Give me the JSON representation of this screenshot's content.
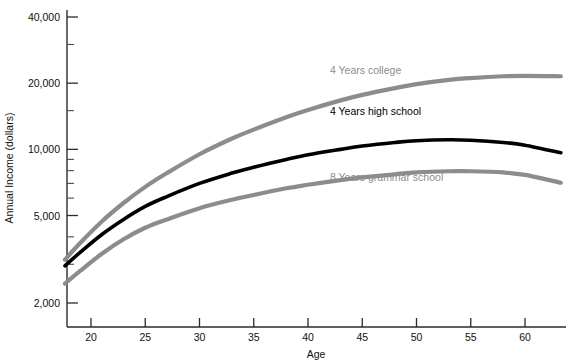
{
  "chart_data": {
    "type": "line",
    "title": "",
    "xlabel": "Age",
    "ylabel": "Annual Income (dollars)",
    "yscale": "log",
    "ylim": [
      1700,
      47000
    ],
    "xlim": [
      17.5,
      63.5
    ],
    "grid": false,
    "legend_position": "inline-on-curve",
    "y_major_ticks": [
      2000,
      5000,
      10000,
      20000,
      40000
    ],
    "y_major_tick_labels": [
      "2,000",
      "5,000",
      "10,000",
      "20,000",
      "40,000"
    ],
    "y_minor_ticks": [
      3000,
      4000,
      6000,
      7000,
      8000,
      9000,
      15000,
      30000
    ],
    "x_ticks": [
      20,
      25,
      30,
      35,
      40,
      45,
      50,
      55,
      60
    ],
    "x_tick_labels": [
      "20",
      "25",
      "30",
      "35",
      "40",
      "45",
      "50",
      "55",
      "60"
    ],
    "x": [
      17.6,
      19,
      21,
      23,
      25,
      27,
      30,
      33,
      35,
      38,
      40,
      43,
      45,
      48,
      50,
      53,
      55,
      58,
      60,
      63.3
    ],
    "series": [
      {
        "name": "4 Years college",
        "label": "4 Years college",
        "color": "#8c8c8c",
        "width": 4.2,
        "label_x": 330,
        "label_y": 74,
        "values": [
          3150,
          3750,
          4700,
          5700,
          6750,
          7800,
          9500,
          11200,
          12300,
          14000,
          15100,
          16700,
          17700,
          19000,
          19800,
          20700,
          21100,
          21500,
          21600,
          21500
        ]
      },
      {
        "name": "4 Years high school",
        "label": "4 Years high school",
        "color": "#000000",
        "width": 3.6,
        "label_x": 330,
        "label_y": 115,
        "values": [
          2950,
          3400,
          4100,
          4800,
          5500,
          6100,
          7000,
          7800,
          8300,
          9000,
          9450,
          10000,
          10350,
          10750,
          10950,
          11050,
          11000,
          10750,
          10450,
          9650
        ]
      },
      {
        "name": "8 Years grammar school",
        "label": "8 Years grammar school",
        "color": "#8c8c8c",
        "width": 4.2,
        "label_x": 330,
        "label_y": 181,
        "values": [
          2450,
          2800,
          3350,
          3900,
          4400,
          4800,
          5400,
          5900,
          6200,
          6650,
          6900,
          7250,
          7450,
          7700,
          7850,
          7950,
          7950,
          7850,
          7650,
          7050
        ]
      }
    ]
  }
}
